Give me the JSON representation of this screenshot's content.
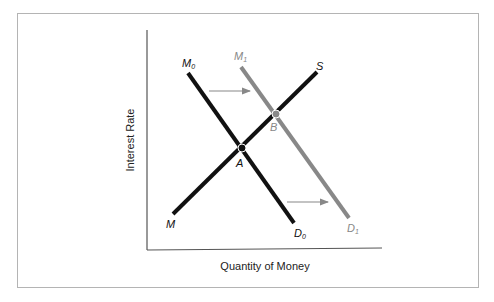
{
  "diagram": {
    "xlabel": "Quantity of Money",
    "ylabel": "Interest Rate",
    "curves": [
      {
        "id": "supply",
        "start_label": "M",
        "end_label": "S",
        "color": "#111111"
      },
      {
        "id": "demand0",
        "start_label": "M0",
        "end_label": "D0",
        "color": "#111111"
      },
      {
        "id": "demand1",
        "start_label": "M1",
        "end_label": "D1",
        "color": "#888888"
      }
    ],
    "points": [
      {
        "label": "A",
        "color": "#111111"
      },
      {
        "label": "B",
        "color": "#888888"
      }
    ],
    "labels": {
      "M": "M",
      "S": "S",
      "M0_main": "M",
      "M0_sub": "0",
      "M1_main": "M",
      "M1_sub": "1",
      "D0_main": "D",
      "D0_sub": "0",
      "D1_main": "D",
      "D1_sub": "1",
      "A": "A",
      "B": "B"
    },
    "colors": {
      "dark": "#111111",
      "gray": "#888888",
      "arrow": "#888888",
      "axis": "#555555"
    }
  }
}
